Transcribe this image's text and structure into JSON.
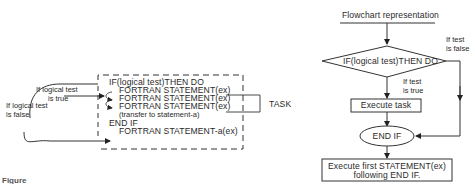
{
  "code_diagram": {
    "label_true_line1": "If logical test",
    "label_true_line2": "is true",
    "label_false_line1": "If logical test",
    "label_false_line2": "is false",
    "lines": [
      "IF(logical test)THEN DO",
      "FORTRAN STATEMENT(ex)",
      "FORTRAN STATEMENT(ex)",
      "FORTRAN STATEMENT(ex)",
      "(transfer to statement-a)",
      "END IF",
      "FORTRAN STATEMENT-a(ex)"
    ],
    "task_label": "TASK"
  },
  "flowchart": {
    "title": "Flowchart representation",
    "decision": "IF(logical test)THEN DO",
    "false_label_line1": "If test",
    "false_label_line2": "is false",
    "true_label_line1": "If test",
    "true_label_line2": "is true",
    "execute_task": "Execute task",
    "end_if": "END IF",
    "final_line1": "Execute first STATEMENT(ex)",
    "final_line2": "following END IF."
  },
  "caption": {
    "figure_label": "Figure"
  }
}
